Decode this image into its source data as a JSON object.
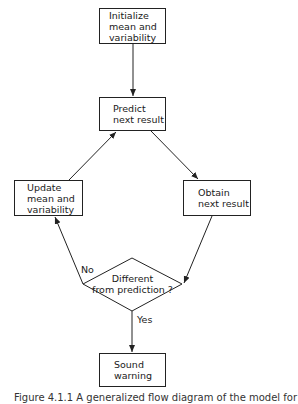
{
  "diagram": {
    "type": "flowchart",
    "nodes": {
      "initialize": {
        "shape": "rect",
        "lines": [
          "Initialize",
          "mean and",
          "variability"
        ]
      },
      "predict": {
        "shape": "rect",
        "lines": [
          "Predict",
          "next result"
        ]
      },
      "update": {
        "shape": "rect",
        "lines": [
          "Update",
          "mean and",
          "variability"
        ]
      },
      "obtain": {
        "shape": "rect",
        "lines": [
          "Obtain",
          "next result"
        ]
      },
      "decision": {
        "shape": "diamond",
        "lines": [
          "Different",
          "from prediction ?"
        ]
      },
      "warning": {
        "shape": "rect",
        "lines": [
          "Sound",
          "warning"
        ]
      }
    },
    "edges": [
      {
        "from": "initialize",
        "to": "predict",
        "label": ""
      },
      {
        "from": "predict",
        "to": "obtain",
        "label": ""
      },
      {
        "from": "obtain",
        "to": "decision",
        "label": ""
      },
      {
        "from": "decision",
        "to": "update",
        "label": "No"
      },
      {
        "from": "update",
        "to": "predict",
        "label": ""
      },
      {
        "from": "decision",
        "to": "warning",
        "label": "Yes"
      }
    ],
    "edge_labels": {
      "no": "No",
      "yes": "Yes"
    },
    "caption": "Figure 4.1.1  A generalized flow diagram of the model for"
  }
}
